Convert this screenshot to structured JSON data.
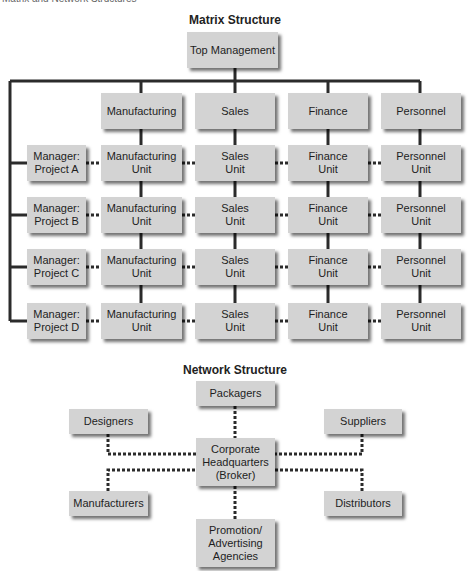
{
  "header": {
    "cut_title": "Matrix and Network Structures"
  },
  "matrix": {
    "title": "Matrix Structure",
    "top": "Top Management",
    "departments": [
      "Manufacturing",
      "Sales",
      "Finance",
      "Personnel"
    ],
    "managers": [
      "Manager:\nProject A",
      "Manager:\nProject B",
      "Manager:\nProject C",
      "Manager:\nProject D"
    ],
    "units": [
      "Manufacturing\nUnit",
      "Sales\nUnit",
      "Finance\nUnit",
      "Personnel\nUnit"
    ]
  },
  "network": {
    "title": "Network Structure",
    "packagers": "Packagers",
    "designers": "Designers",
    "suppliers": "Suppliers",
    "hq": "Corporate\nHeadquarters\n(Broker)",
    "manufacturers": "Manufacturers",
    "distributors": "Distributors",
    "promotion": "Promotion/\nAdvertising\nAgencies"
  }
}
